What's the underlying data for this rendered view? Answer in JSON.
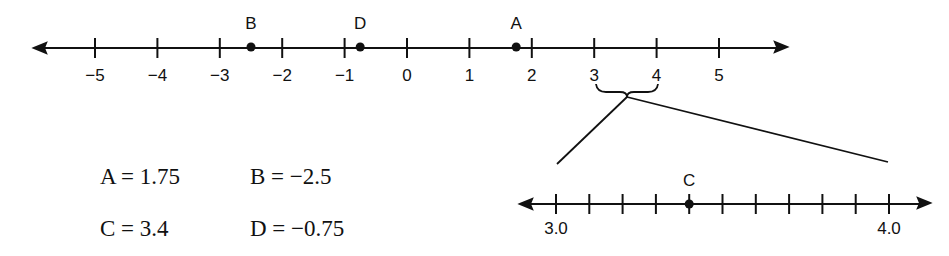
{
  "main_line": {
    "ticks": [
      {
        "value": -5,
        "label": "−5"
      },
      {
        "value": -4,
        "label": "−4"
      },
      {
        "value": -3,
        "label": "−3"
      },
      {
        "value": -2,
        "label": "−2"
      },
      {
        "value": -1,
        "label": "−1"
      },
      {
        "value": 0,
        "label": "0"
      },
      {
        "value": 1,
        "label": "1"
      },
      {
        "value": 2,
        "label": "2"
      },
      {
        "value": 3,
        "label": "3"
      },
      {
        "value": 4,
        "label": "4"
      },
      {
        "value": 5,
        "label": "5"
      }
    ],
    "points": [
      {
        "name": "B",
        "value": -2.5
      },
      {
        "name": "D",
        "value": -0.75
      },
      {
        "name": "A",
        "value": 1.75
      }
    ]
  },
  "zoom_line": {
    "start_label": "3.0",
    "end_label": "4.0",
    "tick_count": 11,
    "points": [
      {
        "name": "C",
        "value": 3.4
      }
    ]
  },
  "equations": [
    {
      "id": "a",
      "text": "A = 1.75"
    },
    {
      "id": "b",
      "text": "B = −2.5"
    },
    {
      "id": "c",
      "text": "C = 3.4"
    },
    {
      "id": "d",
      "text": "D = −0.75"
    }
  ],
  "colors": {
    "ink": "#111111",
    "background": "#ffffff"
  }
}
